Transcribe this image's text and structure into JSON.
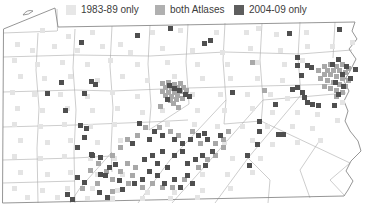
{
  "legend": {
    "items": [
      {
        "label": "1983-89 only",
        "color": "#e7e7e7"
      },
      {
        "label": "both Atlases",
        "color": "#b0b0b0"
      },
      {
        "label": "2004-09 only",
        "color": "#5e5e5e"
      }
    ]
  },
  "map_data": {
    "type": "grid-square thematic map",
    "region": "Pennsylvania with county boundaries",
    "square_size": 5,
    "categories": [
      {
        "name": "1983-89 only",
        "color": "#e4e4e4",
        "points": [
          [
            40,
            28
          ],
          [
            66,
            34
          ],
          [
            90,
            30
          ],
          [
            118,
            42
          ],
          [
            150,
            30
          ],
          [
            178,
            28
          ],
          [
            214,
            30
          ],
          [
            244,
            30
          ],
          [
            274,
            32
          ],
          [
            304,
            30
          ],
          [
            256,
            26
          ],
          [
            15,
            42
          ],
          [
            30,
            48
          ],
          [
            52,
            44
          ],
          [
            75,
            48
          ],
          [
            100,
            44
          ],
          [
            128,
            50
          ],
          [
            160,
            46
          ],
          [
            190,
            48
          ],
          [
            220,
            50
          ],
          [
            248,
            46
          ],
          [
            278,
            48
          ],
          [
            305,
            44
          ],
          [
            330,
            44
          ],
          [
            350,
            40
          ],
          [
            12,
            58
          ],
          [
            35,
            62
          ],
          [
            60,
            60
          ],
          [
            85,
            62
          ],
          [
            108,
            58
          ],
          [
            135,
            62
          ],
          [
            165,
            60
          ],
          [
            195,
            62
          ],
          [
            225,
            62
          ],
          [
            255,
            60
          ],
          [
            282,
            62
          ],
          [
            300,
            58
          ],
          [
            18,
            74
          ],
          [
            42,
            76
          ],
          [
            68,
            74
          ],
          [
            95,
            78
          ],
          [
            120,
            74
          ],
          [
            145,
            78
          ],
          [
            172,
            74
          ],
          [
            200,
            76
          ],
          [
            228,
            76
          ],
          [
            255,
            76
          ],
          [
            280,
            78
          ],
          [
            10,
            90
          ],
          [
            32,
            92
          ],
          [
            58,
            92
          ],
          [
            85,
            94
          ],
          [
            110,
            90
          ],
          [
            135,
            94
          ],
          [
            160,
            108
          ],
          [
            190,
            92
          ],
          [
            218,
            92
          ],
          [
            245,
            92
          ],
          [
            268,
            92
          ],
          [
            285,
            96
          ],
          [
            15,
            106
          ],
          [
            40,
            108
          ],
          [
            65,
            106
          ],
          [
            90,
            108
          ],
          [
            115,
            106
          ],
          [
            140,
            110
          ],
          [
            195,
            108
          ],
          [
            222,
            108
          ],
          [
            250,
            106
          ],
          [
            270,
            110
          ],
          [
            295,
            110
          ],
          [
            315,
            112
          ],
          [
            340,
            100
          ],
          [
            12,
            122
          ],
          [
            38,
            124
          ],
          [
            62,
            122
          ],
          [
            88,
            124
          ],
          [
            112,
            122
          ],
          [
            165,
            122
          ],
          [
            192,
            122
          ],
          [
            215,
            124
          ],
          [
            240,
            124
          ],
          [
            265,
            124
          ],
          [
            290,
            124
          ],
          [
            310,
            126
          ],
          [
            335,
            118
          ],
          [
            18,
            138
          ],
          [
            45,
            140
          ],
          [
            68,
            138
          ],
          [
            95,
            140
          ],
          [
            118,
            138
          ],
          [
            222,
            140
          ],
          [
            250,
            138
          ],
          [
            270,
            142
          ],
          [
            295,
            140
          ],
          [
            318,
            138
          ],
          [
            12,
            154
          ],
          [
            38,
            156
          ],
          [
            62,
            154
          ],
          [
            88,
            156
          ],
          [
            112,
            156
          ],
          [
            230,
            156
          ],
          [
            258,
            156
          ],
          [
            18,
            170
          ],
          [
            45,
            172
          ],
          [
            68,
            170
          ],
          [
            95,
            172
          ],
          [
            120,
            172
          ],
          [
            200,
            172
          ],
          [
            225,
            172
          ],
          [
            250,
            170
          ],
          [
            12,
            186
          ],
          [
            40,
            188
          ],
          [
            65,
            186
          ],
          [
            90,
            186
          ],
          [
            115,
            188
          ],
          [
            145,
            190
          ],
          [
            172,
            190
          ],
          [
            200,
            188
          ],
          [
            228,
            186
          ],
          [
            25,
            195
          ],
          [
            55,
            195
          ],
          [
            85,
            196
          ],
          [
            110,
            196
          ],
          [
            140,
            196
          ],
          [
            168,
            196
          ],
          [
            195,
            195
          ]
        ]
      },
      {
        "name": "both Atlases",
        "color": "#a8a8a8",
        "points": [
          [
            160,
            81
          ],
          [
            166,
            80
          ],
          [
            172,
            82
          ],
          [
            178,
            81
          ],
          [
            163,
            85
          ],
          [
            169,
            86
          ],
          [
            175,
            85
          ],
          [
            181,
            85
          ],
          [
            160,
            89
          ],
          [
            166,
            90
          ],
          [
            172,
            90
          ],
          [
            178,
            89
          ],
          [
            184,
            88
          ],
          [
            163,
            93
          ],
          [
            169,
            94
          ],
          [
            175,
            93
          ],
          [
            168,
            98
          ],
          [
            174,
            97
          ],
          [
            180,
            96
          ],
          [
            171,
            101
          ],
          [
            158,
            104
          ],
          [
            176,
            105
          ],
          [
            322,
            64
          ],
          [
            328,
            62
          ],
          [
            334,
            64
          ],
          [
            340,
            62
          ],
          [
            346,
            66
          ],
          [
            325,
            68
          ],
          [
            331,
            68
          ],
          [
            337,
            68
          ],
          [
            343,
            70
          ],
          [
            322,
            72
          ],
          [
            328,
            72
          ],
          [
            334,
            74
          ],
          [
            340,
            76
          ],
          [
            346,
            78
          ],
          [
            325,
            78
          ],
          [
            331,
            80
          ],
          [
            337,
            82
          ],
          [
            343,
            84
          ],
          [
            328,
            86
          ],
          [
            334,
            88
          ],
          [
            322,
            84
          ],
          [
            318,
            76
          ],
          [
            316,
            68
          ],
          [
            340,
            90
          ],
          [
            334,
            94
          ],
          [
            143,
            125
          ],
          [
            157,
            125
          ],
          [
            168,
            129
          ],
          [
            176,
            133
          ],
          [
            190,
            129
          ],
          [
            198,
            141
          ],
          [
            213,
            141
          ],
          [
            221,
            137
          ],
          [
            226,
            129
          ],
          [
            135,
            133
          ],
          [
            125,
            137
          ],
          [
            118,
            145
          ],
          [
            110,
            153
          ],
          [
            125,
            161
          ],
          [
            133,
            165
          ],
          [
            118,
            169
          ],
          [
            110,
            177
          ],
          [
            126,
            181
          ],
          [
            140,
            185
          ],
          [
            150,
            181
          ],
          [
            160,
            185
          ],
          [
            170,
            185
          ],
          [
            182,
            177
          ],
          [
            196,
            165
          ],
          [
            205,
            157
          ],
          [
            213,
            153
          ],
          [
            221,
            145
          ],
          [
            96,
            161
          ],
          [
            104,
            169
          ],
          [
            88,
            168
          ],
          [
            80,
            186
          ],
          [
            95,
            181
          ],
          [
            110,
            189
          ],
          [
            130,
            173
          ],
          [
            250,
            60
          ],
          [
            262,
            88
          ]
        ]
      },
      {
        "name": "2004-09 only",
        "color": "#4f4f4f",
        "points": [
          [
            135,
            33
          ],
          [
            168,
            26
          ],
          [
            202,
            41
          ],
          [
            208,
            38
          ],
          [
            230,
            90
          ],
          [
            287,
            31
          ],
          [
            337,
            27
          ],
          [
            353,
            67
          ],
          [
            309,
            65
          ],
          [
            295,
            63
          ],
          [
            79,
            40
          ],
          [
            59,
            80
          ],
          [
            89,
            79
          ],
          [
            93,
            82
          ],
          [
            45,
            91
          ],
          [
            82,
            91
          ],
          [
            63,
            108
          ],
          [
            330,
            62
          ],
          [
            336,
            57
          ],
          [
            344,
            64
          ],
          [
            340,
            72
          ],
          [
            348,
            76
          ],
          [
            333,
            80
          ],
          [
            341,
            84
          ],
          [
            336,
            92
          ],
          [
            295,
            55
          ],
          [
            305,
            63
          ],
          [
            299,
            73
          ],
          [
            295,
            85
          ],
          [
            305,
            100
          ],
          [
            316,
            103
          ],
          [
            290,
            87
          ],
          [
            300,
            90
          ],
          [
            302,
            95
          ],
          [
            273,
            102
          ],
          [
            310,
            102
          ],
          [
            332,
            103
          ],
          [
            167,
            83
          ],
          [
            172,
            86
          ],
          [
            177,
            88
          ],
          [
            183,
            92
          ],
          [
            187,
            94
          ],
          [
            165,
            97
          ],
          [
            137,
            121
          ],
          [
            152,
            129
          ],
          [
            160,
            133
          ],
          [
            147,
            137
          ],
          [
            130,
            141
          ],
          [
            172,
            137
          ],
          [
            180,
            141
          ],
          [
            188,
            137
          ],
          [
            196,
            133
          ],
          [
            205,
            137
          ],
          [
            202,
            131
          ],
          [
            218,
            133
          ],
          [
            180,
            149
          ],
          [
            172,
            153
          ],
          [
            160,
            149
          ],
          [
            150,
            153
          ],
          [
            142,
            157
          ],
          [
            155,
            161
          ],
          [
            165,
            165
          ],
          [
            185,
            161
          ],
          [
            193,
            157
          ],
          [
            200,
            153
          ],
          [
            210,
            149
          ],
          [
            147,
            169
          ],
          [
            155,
            173
          ],
          [
            140,
            177
          ],
          [
            132,
            181
          ],
          [
            162,
            181
          ],
          [
            172,
            177
          ],
          [
            185,
            173
          ],
          [
            190,
            181
          ],
          [
            178,
            185
          ],
          [
            107,
            165
          ],
          [
            98,
            172
          ],
          [
            75,
            175
          ],
          [
            82,
            180
          ],
          [
            65,
            192
          ],
          [
            70,
            197
          ],
          [
            97,
            190
          ],
          [
            105,
            195
          ],
          [
            120,
            187
          ],
          [
            117,
            178
          ],
          [
            90,
            153
          ],
          [
            78,
            123
          ],
          [
            84,
            126
          ],
          [
            82,
            135
          ],
          [
            75,
            145
          ],
          [
            89,
            152
          ],
          [
            98,
            155
          ],
          [
            103,
            173
          ],
          [
            113,
            162
          ],
          [
            257,
            119
          ],
          [
            257,
            129
          ],
          [
            276,
            132
          ],
          [
            281,
            132
          ],
          [
            255,
            142
          ],
          [
            245,
            153
          ],
          [
            203,
            163
          ],
          [
            247,
            163
          ]
        ]
      }
    ]
  }
}
